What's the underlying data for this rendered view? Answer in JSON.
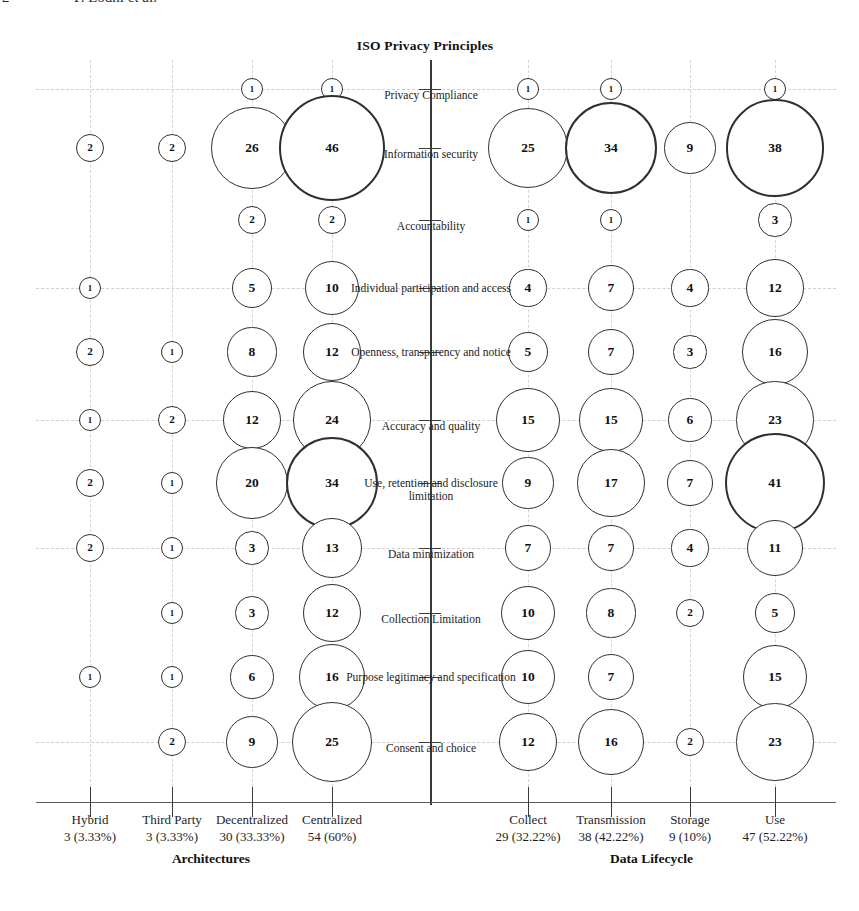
{
  "running_head": {
    "folio": "2",
    "authors": "P. Lodhi et al."
  },
  "chart_data": {
    "type": "bar",
    "subtype": "bubble-matrix",
    "title": "ISO Privacy Principles",
    "xlabel": "",
    "ylabel": "",
    "grid": true,
    "legend": "none",
    "panels": [
      {
        "name": "Architectures",
        "group_label": "Architectures",
        "side": "left",
        "categories": [
          "Hybrid",
          "Third Party",
          "Decentralized",
          "Centralized"
        ],
        "totals": [
          "3 (3.33%)",
          "3 (3.33%)",
          "30 (33.33%)",
          "54 (60%)"
        ]
      },
      {
        "name": "Data Lifecycle",
        "group_label": "Data Lifecycle",
        "side": "right",
        "categories": [
          "Collect",
          "Transmission",
          "Storage",
          "Use"
        ],
        "totals": [
          "29 (32.22%)",
          "38 (42.22%)",
          "9 (10%)",
          "47 (52.22%)"
        ]
      }
    ],
    "principles": [
      "Privacy Compliance",
      "Information security",
      "Accountability",
      "Individual participation and access",
      "Openness, transparency and notice",
      "Accuracy and quality",
      "Use, retention and disclosure limitation",
      "Data minimization",
      "Collection Limitation",
      "Purpose legitimacy and specification",
      "Consent and choice"
    ],
    "series": [
      {
        "name": "Hybrid",
        "panel": "Architectures",
        "values": [
          null,
          2,
          null,
          1,
          2,
          1,
          2,
          2,
          null,
          1,
          null
        ]
      },
      {
        "name": "Third Party",
        "panel": "Architectures",
        "values": [
          null,
          2,
          null,
          null,
          1,
          2,
          1,
          1,
          1,
          1,
          2
        ]
      },
      {
        "name": "Decentralized",
        "panel": "Architectures",
        "values": [
          1,
          26,
          2,
          5,
          8,
          12,
          20,
          3,
          3,
          6,
          9
        ]
      },
      {
        "name": "Centralized",
        "panel": "Architectures",
        "values": [
          1,
          46,
          2,
          10,
          12,
          24,
          34,
          13,
          12,
          16,
          25
        ]
      },
      {
        "name": "Collect",
        "panel": "Data Lifecycle",
        "values": [
          1,
          25,
          1,
          4,
          5,
          15,
          9,
          7,
          10,
          10,
          12
        ]
      },
      {
        "name": "Transmission",
        "panel": "Data Lifecycle",
        "values": [
          1,
          34,
          1,
          7,
          7,
          15,
          17,
          7,
          8,
          7,
          16
        ]
      },
      {
        "name": "Storage",
        "panel": "Data Lifecycle",
        "values": [
          null,
          9,
          null,
          4,
          3,
          6,
          7,
          4,
          2,
          null,
          2
        ]
      },
      {
        "name": "Use",
        "panel": "Data Lifecycle",
        "values": [
          1,
          38,
          3,
          12,
          16,
          23,
          41,
          11,
          5,
          15,
          23
        ]
      }
    ]
  },
  "colors": {
    "bubble_stroke": "#2f2f2f",
    "axis": "#3a3a3a",
    "grid": "#cfcfcf",
    "text": "#1a1a1a",
    "background": "#ffffff"
  }
}
